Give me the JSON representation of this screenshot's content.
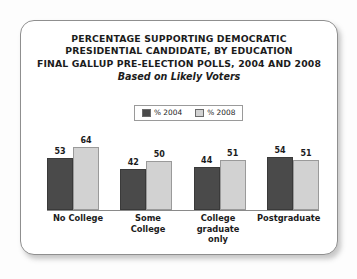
{
  "card": {
    "title_lines": [
      "PERCENTAGE SUPPORTING DEMOCRATIC",
      "PRESIDENTIAL CANDIDATE, BY EDUCATION",
      "FINAL GALLUP PRE-ELECTION POLLS, 2004 AND 2008"
    ],
    "subtitle": "Based on Likely Voters"
  },
  "colors": {
    "series_2004": "#4a4a4a",
    "series_2008": "#d2d2d2",
    "axis": "#8a8a8a",
    "card_border": "#8f8f8f",
    "text": "#1c1c1c"
  },
  "chart_data": {
    "type": "bar",
    "title": "PERCENTAGE SUPPORTING DEMOCRATIC PRESIDENTIAL CANDIDATE, BY EDUCATION FINAL GALLUP PRE-ELECTION POLLS, 2004 AND 2008",
    "subtitle": "Based on Likely Voters",
    "categories": [
      "No College",
      "Some College",
      "College graduate only",
      "Postgraduate"
    ],
    "category_lines": [
      [
        "No College"
      ],
      [
        "Some College"
      ],
      [
        "College",
        "graduate only"
      ],
      [
        "Postgraduate"
      ]
    ],
    "series": [
      {
        "name": "% 2004",
        "values": [
          53,
          42,
          44,
          54
        ],
        "color": "#4a4a4a"
      },
      {
        "name": "% 2008",
        "values": [
          64,
          50,
          51,
          51
        ],
        "color": "#d2d2d2"
      }
    ],
    "xlabel": "",
    "ylabel": "",
    "ylim": [
      0,
      70
    ],
    "grid": false,
    "legend_position": "top-center",
    "data_labels": true
  }
}
